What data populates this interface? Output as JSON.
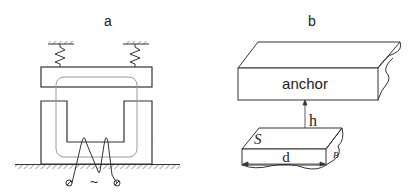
{
  "panels": {
    "a": {
      "label": "a",
      "ac_symbol": "~"
    },
    "b": {
      "label": "b",
      "anchor_label": "anchor",
      "gap_label": "h",
      "surface_label": "S",
      "width_label": "d",
      "thickness_label": "B"
    }
  },
  "colors": {
    "stroke": "#333333",
    "coil": "#9a9a9a",
    "background": "#ffffff"
  }
}
